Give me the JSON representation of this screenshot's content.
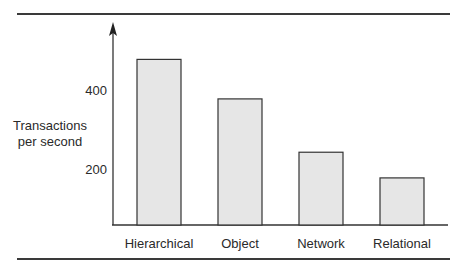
{
  "chart_data": {
    "type": "bar",
    "title": "",
    "xlabel": "",
    "ylabel": "Transactions per second",
    "ylabel_lines": [
      "Transactions",
      "per second"
    ],
    "categories": [
      "Hierarchical",
      "Object",
      "Network",
      "Relational"
    ],
    "values": [
      480,
      380,
      245,
      180
    ],
    "y_ticks": [
      200,
      400
    ],
    "y_tick_labels": [
      "200",
      "400"
    ],
    "ylim": [
      0,
      550
    ],
    "grid": false,
    "legend": null,
    "bar_color": "#e6e6e6",
    "bar_edge_color": "#333333"
  }
}
